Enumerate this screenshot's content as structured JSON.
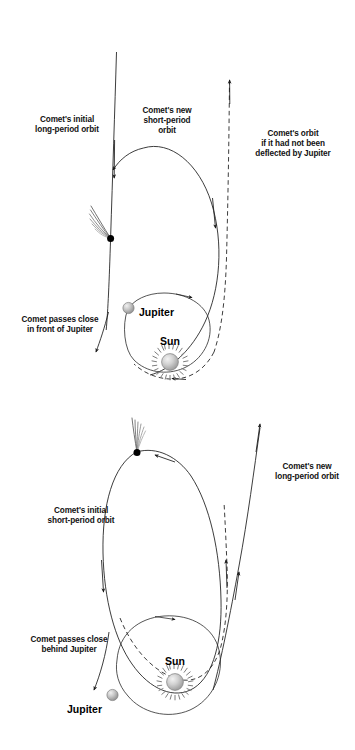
{
  "figure": {
    "background_color": "#ffffff",
    "line_color": "#1a1a1a"
  },
  "panels": [
    {
      "id": "top-panel",
      "name": "comet-captured-into-short-period-orbit",
      "labels": {
        "initial_orbit": "Comet's initial\nlong-period orbit",
        "initial_orbit_line1": "Comet's initial",
        "initial_orbit_line2": "long-period orbit",
        "new_orbit_line1": "Comet's new",
        "new_orbit_line2": "short-period",
        "new_orbit_line3": "orbit",
        "undeflected_line1": "Comet's orbit",
        "undeflected_line2": "if it had not been",
        "undeflected_line3": "deflected by Jupiter",
        "encounter_line1": "Comet passes close",
        "encounter_line2": "in front of Jupiter",
        "jupiter": "Jupiter",
        "sun": "Sun"
      }
    },
    {
      "id": "bottom-panel",
      "name": "comet-ejected-into-long-period-orbit",
      "labels": {
        "new_orbit_line1": "Comet's new",
        "new_orbit_line2": "long-period orbit",
        "initial_orbit_line1": "Comet's initial",
        "initial_orbit_line2": "short-period orbit",
        "encounter_line1": "Comet passes close",
        "encounter_line2": "behind Jupiter",
        "jupiter": "Jupiter",
        "sun": "Sun"
      }
    }
  ],
  "bodies": {
    "sun": {
      "label": "Sun",
      "icon": "sun-icon",
      "color": "#b9b9b9",
      "ray_count": 22
    },
    "jupiter": {
      "label": "Jupiter",
      "icon": "planet-icon",
      "color": "#b0b0b0"
    },
    "comet": {
      "icon": "comet-icon",
      "nucleus_color": "#000000",
      "tail_color": "#8a8a8a"
    }
  }
}
